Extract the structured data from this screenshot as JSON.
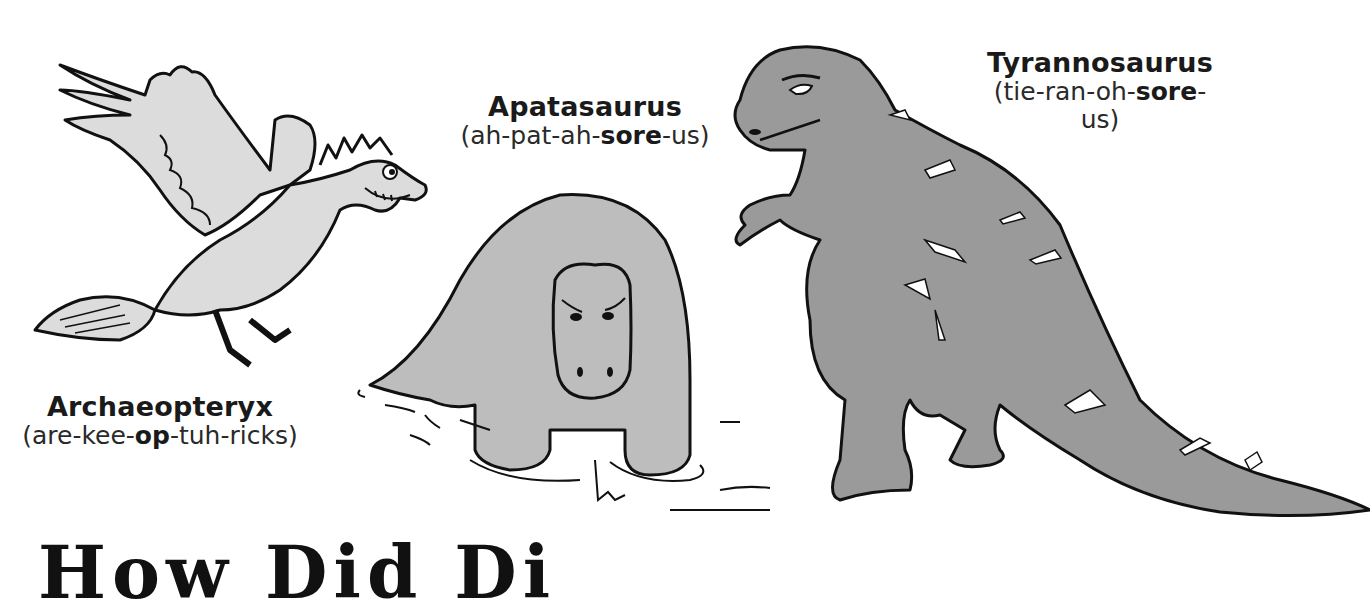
{
  "illustrations": [
    {
      "id": "archaeopteryx",
      "name": "Archaeopteryx",
      "pronunciation": {
        "before": "(are-kee-",
        "stressed": "op",
        "after": "-tuh-ricks)"
      },
      "fill": "#dcdcdc"
    },
    {
      "id": "apatasaurus",
      "name": "Apatasaurus",
      "pronunciation": {
        "before": "(ah-pat-ah-",
        "stressed": "sore",
        "after": "-us)"
      },
      "fill": "#bdbdbd"
    },
    {
      "id": "tyrannosaurus",
      "name": "Tyrannosaurus",
      "pronunciation": {
        "before": "(tie-ran-oh-",
        "stressed": "sore",
        "after": "-us)"
      },
      "fill": "#9a9a9a"
    }
  ],
  "footer_heading": {
    "text": "How Did Di"
  },
  "colors": {
    "outline": "#111111",
    "background": "#ffffff"
  }
}
